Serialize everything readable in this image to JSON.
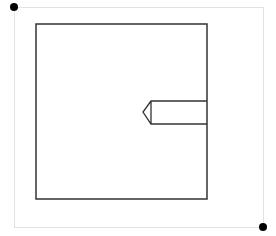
{
  "canvas": {
    "width": 276,
    "height": 236,
    "background": "#ffffff"
  },
  "selection_box": {
    "x": 14,
    "y": 7,
    "width": 249,
    "height": 220,
    "stroke": "#e2e2e2"
  },
  "handles": [
    {
      "name": "top-left",
      "cx": 14,
      "cy": 7,
      "r": 4,
      "fill": "#000000"
    },
    {
      "name": "bottom-right",
      "cx": 263,
      "cy": 227,
      "r": 4,
      "fill": "#000000"
    }
  ],
  "shape": {
    "outer_square": {
      "x": 36,
      "y": 24,
      "width": 171,
      "height": 175,
      "stroke": "#333333"
    },
    "tab": {
      "top_y": 101,
      "bottom_y": 124,
      "left_x": 151,
      "right_x": 207,
      "tip_x": 143,
      "tip_y": 112,
      "stroke": "#333333"
    }
  }
}
